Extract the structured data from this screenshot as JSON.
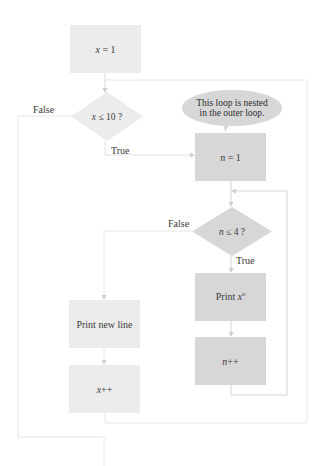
{
  "colors": {
    "light_box": "#ececec",
    "dark_box": "#d7d7d7",
    "line": "#d4d4d4",
    "outer_line": "#e6e6e6",
    "text": "#3a3a3a"
  },
  "outer_loop": {
    "init": {
      "var": "x",
      "op": " = 1"
    },
    "condition": {
      "var": "x",
      "op": " ≤ 10 ?"
    },
    "false_label": "False",
    "true_label": "True",
    "print_newline": "Print new line",
    "increment": {
      "var": "x",
      "op": "++"
    }
  },
  "inner_loop": {
    "annotation": {
      "line1": "This loop is nested",
      "line2": "in the outer loop."
    },
    "init": {
      "var": "n",
      "op": " = 1"
    },
    "condition": {
      "var": "n",
      "op": " ≤ 4 ?"
    },
    "false_label": "False",
    "true_label": "True",
    "print": {
      "prefix": "Print ",
      "base": "x",
      "exponent": "n"
    },
    "increment": {
      "var": "n",
      "op": "++"
    }
  }
}
